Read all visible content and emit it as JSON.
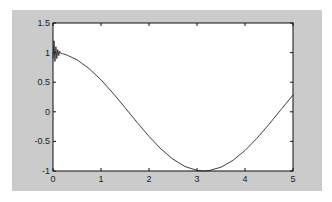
{
  "chart_data": {
    "type": "line",
    "title": "",
    "xlabel": "",
    "ylabel": "",
    "xlim": [
      0,
      5
    ],
    "ylim": [
      -1,
      1.5
    ],
    "grid": false,
    "legend": null,
    "xticks": [
      "0",
      "1",
      "2",
      "3",
      "4",
      "5"
    ],
    "yticks": [
      "-1",
      "-0.5",
      "0",
      "0.5",
      "1",
      "1.5"
    ],
    "series": [
      {
        "name": "signal",
        "description": "approximately cos(x) with a short high-frequency oscillation near x=0",
        "x": [
          0,
          0.02,
          0.04,
          0.06,
          0.08,
          0.1,
          0.12,
          0.14,
          0.16,
          0.2,
          0.25,
          0.3,
          0.5,
          0.75,
          1.0,
          1.25,
          1.5,
          1.75,
          2.0,
          2.25,
          2.5,
          2.75,
          3.0,
          3.14,
          3.25,
          3.5,
          3.75,
          4.0,
          4.25,
          4.5,
          4.75,
          5.0
        ],
        "y": [
          0.9,
          1.2,
          0.85,
          1.1,
          0.9,
          1.05,
          0.95,
          1.02,
          0.99,
          0.98,
          0.97,
          0.955,
          0.878,
          0.732,
          0.54,
          0.315,
          0.071,
          -0.178,
          -0.416,
          -0.628,
          -0.801,
          -0.924,
          -0.99,
          -1.0,
          -0.994,
          -0.936,
          -0.82,
          -0.654,
          -0.446,
          -0.211,
          0.038,
          0.284
        ]
      }
    ],
    "colors": {
      "line": "#2a2a2a",
      "figure_bg": "#cbcbcb",
      "axes_bg": "#ffffff"
    }
  }
}
